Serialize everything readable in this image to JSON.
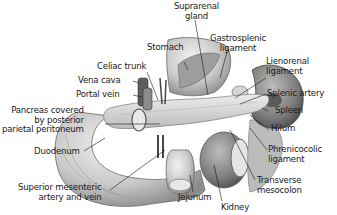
{
  "diagram": {
    "labels": {
      "suprarenal_gland": [
        "Suprarenal",
        "gland"
      ],
      "stomach": "Stomach",
      "gastrosplenic_ligament": [
        "Gastrosplenic",
        "ligament"
      ],
      "celiac_trunk": "Celiac trunk",
      "lienorenal_ligament": [
        "Lienorenal",
        "ligament"
      ],
      "vena_cava": "Vena cava",
      "portal_vein": "Portal vein",
      "splenic_artery": "Splenic artery",
      "pancreas": [
        "Pancreas covered",
        "by posterior",
        "parietal peritoneum"
      ],
      "spleen": "Spleen",
      "hilum": "Hilum",
      "duodenum": "Duodenum",
      "phrenicocolic_ligament": [
        "Phrenicocolic",
        "ligament"
      ],
      "transverse_mesocolon": [
        "Transverse",
        "mesocolon"
      ],
      "superior_mesenteric": [
        "Superior mesenteric",
        "artery and vein"
      ],
      "jejunum": "Jejunum",
      "kidney": "Kidney"
    }
  }
}
